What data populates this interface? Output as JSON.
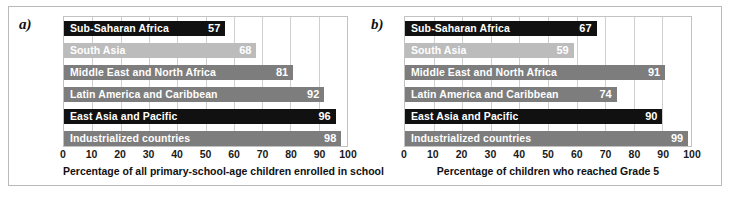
{
  "figure": {
    "panel_a_label": "a)",
    "panel_b_label": "b)"
  },
  "chart_data": [
    {
      "type": "bar",
      "orientation": "horizontal",
      "panel": "a)",
      "title": "",
      "xlabel": "Percentage of all primary-school-age children enrolled in school",
      "ylabel": "",
      "xlim": [
        0,
        100
      ],
      "xticks": [
        0,
        10,
        20,
        30,
        40,
        50,
        60,
        70,
        80,
        90,
        100
      ],
      "xtick_labels": [
        "0",
        "10",
        "20",
        "30",
        "40",
        "50",
        "60",
        "70",
        "80",
        "90",
        "100"
      ],
      "grid": true,
      "legend": "none",
      "categories": [
        "Sub-Saharan Africa",
        "South Asia",
        "Middle East and North Africa",
        "Latin America and Caribbean",
        "East Asia and Pacific",
        "Industrialized countries"
      ],
      "values": [
        57,
        68,
        81,
        92,
        96,
        98
      ],
      "value_labels": [
        "57",
        "68",
        "81",
        "92",
        "96",
        "98"
      ],
      "bar_shades": [
        "dark",
        "light",
        "mid",
        "mid",
        "dark",
        "mid"
      ],
      "colors": {
        "dark": "#111111",
        "mid": "#7d7d7d",
        "light": "#bcbcbc",
        "gridline": "#cfcfcf",
        "frame": "#c2c2c2"
      }
    },
    {
      "type": "bar",
      "orientation": "horizontal",
      "panel": "b)",
      "title": "",
      "xlabel": "Percentage of children who reached Grade 5",
      "ylabel": "",
      "xlim": [
        0,
        100
      ],
      "xticks": [
        0,
        10,
        20,
        30,
        40,
        50,
        60,
        70,
        80,
        90,
        100
      ],
      "xtick_labels": [
        "0",
        "10",
        "20",
        "30",
        "40",
        "50",
        "60",
        "70",
        "80",
        "90",
        "100"
      ],
      "grid": true,
      "legend": "none",
      "categories": [
        "Sub-Saharan Africa",
        "South Asia",
        "Middle East and North Africa",
        "Latin America and Caribbean",
        "East Asia and Pacific",
        "Industrialized countries"
      ],
      "values": [
        67,
        59,
        91,
        74,
        90,
        99
      ],
      "value_labels": [
        "67",
        "59",
        "91",
        "74",
        "90",
        "99"
      ],
      "bar_shades": [
        "dark",
        "light",
        "mid",
        "mid",
        "dark",
        "mid"
      ],
      "colors": {
        "dark": "#111111",
        "mid": "#7d7d7d",
        "light": "#bcbcbc",
        "gridline": "#cfcfcf",
        "frame": "#c2c2c2"
      }
    }
  ]
}
